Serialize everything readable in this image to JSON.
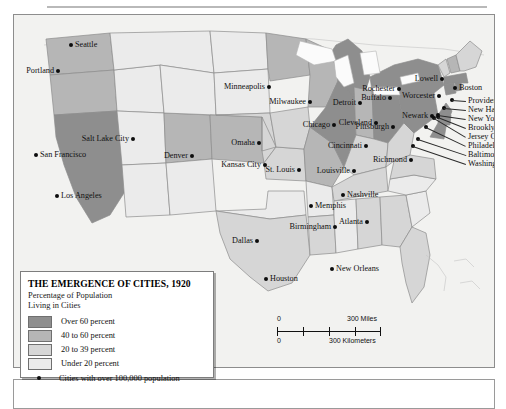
{
  "title": "The Emergence of Cities, 1920",
  "legend": {
    "title": "THE EMERGENCE OF CITIES, 1920",
    "subtitle_line1": "Percentage of Population",
    "subtitle_line2": "Living in Cities",
    "entries": [
      {
        "label": "Over 60 percent",
        "color": "#8e8e8e"
      },
      {
        "label": "40 to 60 percent",
        "color": "#b6b6b6"
      },
      {
        "label": "20 to 39 percent",
        "color": "#d6d6d6"
      },
      {
        "label": "Under 20 percent",
        "color": "#ebebeb"
      }
    ],
    "city_note": "Cities with over 100,000 population"
  },
  "scale": {
    "miles_zero": "0",
    "miles_label": "300 Miles",
    "km_zero": "0",
    "km_label": "300 Kilometers"
  },
  "colors": {
    "over60": "#8e8e8e",
    "pct40to60": "#b6b6b6",
    "pct20to39": "#d6d6d6",
    "under20": "#ebebeb",
    "water": "#fbfbfb",
    "ocean": "#f2f2f0",
    "outline": "#8d8d8d",
    "dot": "#0d0d0d"
  },
  "map_data": {
    "type": "choropleth-map",
    "region": "United States",
    "year": "1920",
    "variable": "Percentage of Population Living in Cities",
    "classes": [
      "Over 60 percent",
      "40 to 60 percent",
      "20 to 39 percent",
      "Under 20 percent"
    ],
    "states": [
      {
        "name": "Washington",
        "class": "pct40to60"
      },
      {
        "name": "Oregon",
        "class": "pct40to60"
      },
      {
        "name": "California",
        "class": "over60"
      },
      {
        "name": "Idaho",
        "class": "under20"
      },
      {
        "name": "Nevada",
        "class": "under20"
      },
      {
        "name": "Utah",
        "class": "pct40to60"
      },
      {
        "name": "Arizona",
        "class": "under20"
      },
      {
        "name": "Montana",
        "class": "under20"
      },
      {
        "name": "Wyoming",
        "class": "under20"
      },
      {
        "name": "Colorado",
        "class": "pct40to60"
      },
      {
        "name": "New Mexico",
        "class": "under20"
      },
      {
        "name": "North Dakota",
        "class": "under20"
      },
      {
        "name": "South Dakota",
        "class": "under20"
      },
      {
        "name": "Nebraska",
        "class": "pct20to39"
      },
      {
        "name": "Kansas",
        "class": "pct20to39"
      },
      {
        "name": "Oklahoma",
        "class": "under20"
      },
      {
        "name": "Texas",
        "class": "pct20to39"
      },
      {
        "name": "Minnesota",
        "class": "pct40to60"
      },
      {
        "name": "Iowa",
        "class": "pct20to39"
      },
      {
        "name": "Missouri",
        "class": "pct40to60"
      },
      {
        "name": "Arkansas",
        "class": "under20"
      },
      {
        "name": "Louisiana",
        "class": "pct20to39"
      },
      {
        "name": "Wisconsin",
        "class": "pct40to60"
      },
      {
        "name": "Illinois",
        "class": "over60"
      },
      {
        "name": "Michigan",
        "class": "over60"
      },
      {
        "name": "Indiana",
        "class": "pct40to60"
      },
      {
        "name": "Ohio",
        "class": "over60"
      },
      {
        "name": "Kentucky",
        "class": "pct20to39"
      },
      {
        "name": "Tennessee",
        "class": "pct20to39"
      },
      {
        "name": "Mississippi",
        "class": "under20"
      },
      {
        "name": "Alabama",
        "class": "pct20to39"
      },
      {
        "name": "Georgia",
        "class": "pct20to39"
      },
      {
        "name": "Florida",
        "class": "pct20to39"
      },
      {
        "name": "South Carolina",
        "class": "under20"
      },
      {
        "name": "North Carolina",
        "class": "under20"
      },
      {
        "name": "Virginia",
        "class": "pct20to39"
      },
      {
        "name": "West Virginia",
        "class": "pct20to39"
      },
      {
        "name": "Pennsylvania",
        "class": "over60"
      },
      {
        "name": "New York",
        "class": "over60"
      },
      {
        "name": "New Jersey",
        "class": "over60"
      },
      {
        "name": "Maryland",
        "class": "over60"
      },
      {
        "name": "Delaware",
        "class": "over60"
      },
      {
        "name": "Connecticut",
        "class": "over60"
      },
      {
        "name": "Rhode Island",
        "class": "over60"
      },
      {
        "name": "Massachusetts",
        "class": "over60"
      },
      {
        "name": "Vermont",
        "class": "pct20to39"
      },
      {
        "name": "New Hampshire",
        "class": "pct40to60"
      },
      {
        "name": "Maine",
        "class": "pct20to39"
      }
    ],
    "cities": [
      {
        "name": "Seattle",
        "x": 57,
        "y": 30,
        "side": "right"
      },
      {
        "name": "Portland",
        "x": 44,
        "y": 56,
        "side": "left"
      },
      {
        "name": "San Francisco",
        "x": 22,
        "y": 140,
        "side": "right"
      },
      {
        "name": "Los Angeles",
        "x": 43,
        "y": 181,
        "side": "right"
      },
      {
        "name": "Salt Lake City",
        "x": 119,
        "y": 124,
        "side": "left"
      },
      {
        "name": "Denver",
        "x": 178,
        "y": 141,
        "side": "left"
      },
      {
        "name": "Minneapolis",
        "x": 255,
        "y": 72,
        "side": "left"
      },
      {
        "name": "Milwaukee",
        "x": 296,
        "y": 87,
        "side": "left"
      },
      {
        "name": "Omaha",
        "x": 245,
        "y": 128,
        "side": "left"
      },
      {
        "name": "Kansas City",
        "x": 251,
        "y": 150,
        "side": "left"
      },
      {
        "name": "St. Louis",
        "x": 285,
        "y": 155,
        "side": "left"
      },
      {
        "name": "Chicago",
        "x": 320,
        "y": 110,
        "side": "left"
      },
      {
        "name": "Detroit",
        "x": 346,
        "y": 88,
        "side": "left"
      },
      {
        "name": "Cleveland",
        "x": 362,
        "y": 108,
        "side": "left"
      },
      {
        "name": "Cincinnati",
        "x": 352,
        "y": 131,
        "side": "left"
      },
      {
        "name": "Louisville",
        "x": 340,
        "y": 156,
        "side": "left"
      },
      {
        "name": "Memphis",
        "x": 297,
        "y": 191,
        "side": "right"
      },
      {
        "name": "Nashville",
        "x": 329,
        "y": 180,
        "side": "right"
      },
      {
        "name": "Birmingham",
        "x": 321,
        "y": 212,
        "side": "left"
      },
      {
        "name": "Atlanta",
        "x": 353,
        "y": 207,
        "side": "left"
      },
      {
        "name": "Dallas",
        "x": 243,
        "y": 226,
        "side": "left"
      },
      {
        "name": "Houston",
        "x": 252,
        "y": 264,
        "side": "right"
      },
      {
        "name": "New Orleans",
        "x": 318,
        "y": 254,
        "side": "right"
      },
      {
        "name": "Richmond",
        "x": 397,
        "y": 145,
        "side": "left"
      },
      {
        "name": "Rochester",
        "x": 385,
        "y": 74,
        "side": "left"
      },
      {
        "name": "Buffalo",
        "x": 376,
        "y": 83,
        "side": "left"
      },
      {
        "name": "Pittsburgh",
        "x": 379,
        "y": 112,
        "side": "left"
      },
      {
        "name": "Worcester",
        "x": 425,
        "y": 81,
        "side": "left"
      },
      {
        "name": "Newark",
        "x": 418,
        "y": 101,
        "side": "left"
      },
      {
        "name": "Lowell",
        "x": 428,
        "y": 64,
        "side": "left"
      },
      {
        "name": "Boston",
        "x": 441,
        "y": 73,
        "side": "right"
      }
    ],
    "stacked_cities": [
      {
        "name": "Providence",
        "anchor_x": 438,
        "anchor_y": 85,
        "label_y": 86
      },
      {
        "name": "New Haven",
        "anchor_x": 430,
        "anchor_y": 93,
        "label_y": 95
      },
      {
        "name": "New York",
        "anchor_x": 424,
        "anchor_y": 100,
        "label_y": 104
      },
      {
        "name": "Brooklyn",
        "anchor_x": 424,
        "anchor_y": 102,
        "label_y": 113
      },
      {
        "name": "Jersey City",
        "anchor_x": 420,
        "anchor_y": 103,
        "label_y": 122
      },
      {
        "name": "Philadelphia",
        "anchor_x": 412,
        "anchor_y": 112,
        "label_y": 131
      },
      {
        "name": "Baltimore",
        "anchor_x": 404,
        "anchor_y": 124,
        "label_y": 140
      },
      {
        "name": "Washington",
        "anchor_x": 399,
        "anchor_y": 131,
        "label_y": 149
      }
    ]
  }
}
